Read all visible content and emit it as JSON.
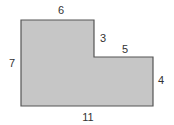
{
  "figure": {
    "shape": "L-shaped rectilinear polygon",
    "fill_color": "#c6c6c6",
    "stroke_color": "#555555",
    "labels": {
      "top": "6",
      "step_vertical": "3",
      "step_horizontal": "5",
      "left": "7",
      "right": "4",
      "bottom": "11"
    }
  }
}
